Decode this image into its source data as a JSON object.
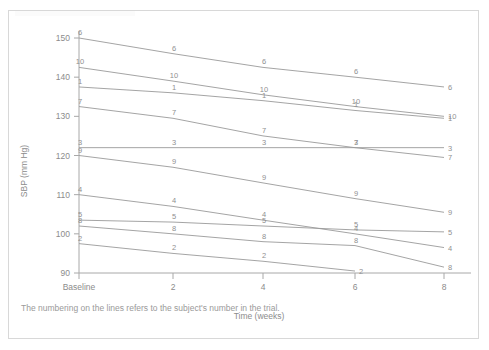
{
  "caption": "The numbering on the lines refers to the subject's number in the trial.",
  "axes": {
    "ylabel": "SBP (mm Hg)",
    "xlabel": "Time (weeks)",
    "ytick_labels": [
      "90",
      "100",
      "110",
      "120",
      "130",
      "140",
      "150"
    ],
    "xtick_labels": [
      "Baseline",
      "2",
      "4",
      "6",
      "8"
    ]
  },
  "colors": {
    "line": "#9a9a9a",
    "axis": "#a8a8a8",
    "text": "#8c8c8c",
    "border": "#d8d8d8",
    "background": "#ffffff"
  },
  "chart_data": {
    "type": "line",
    "title": "",
    "xlabel": "Time (weeks)",
    "ylabel": "SBP (mm Hg)",
    "xlim": [
      0,
      8
    ],
    "ylim": [
      88,
      152
    ],
    "grid": false,
    "legend": "none",
    "x": [
      0,
      2,
      4,
      6,
      8
    ],
    "xtick_labels": [
      "Baseline",
      "2",
      "4",
      "6",
      "8"
    ],
    "ytick_values": [
      90,
      100,
      110,
      120,
      130,
      140,
      150
    ],
    "annotation": "The numbering on the lines refers to the subject's number in the trial.",
    "series": [
      {
        "name": "6",
        "label": "6",
        "values": [
          150.0,
          146.0,
          142.5,
          140.0,
          137.5
        ]
      },
      {
        "name": "10",
        "label": "10",
        "values": [
          142.5,
          139.0,
          135.5,
          132.5,
          130.0
        ]
      },
      {
        "name": "1",
        "label": "1",
        "values": [
          137.5,
          136.0,
          134.0,
          131.5,
          129.5
        ]
      },
      {
        "name": "7",
        "label": "7",
        "values": [
          132.5,
          129.5,
          125.0,
          122.0,
          119.5
        ]
      },
      {
        "name": "3",
        "label": "3",
        "values": [
          122.0,
          122.0,
          122.0,
          122.0,
          122.0
        ]
      },
      {
        "name": "9",
        "label": "9",
        "values": [
          120.0,
          117.0,
          113.0,
          109.0,
          105.5
        ]
      },
      {
        "name": "4",
        "label": "4",
        "values": [
          110.0,
          107.0,
          103.5,
          100.0,
          96.5
        ]
      },
      {
        "name": "5",
        "label": "5",
        "values": [
          103.5,
          103.0,
          102.0,
          101.0,
          100.5
        ]
      },
      {
        "name": "8",
        "label": "8",
        "values": [
          102.0,
          100.0,
          98.0,
          97.0,
          91.5
        ]
      },
      {
        "name": "2",
        "label": "2",
        "values": [
          97.5,
          95.0,
          93.0,
          90.5,
          null
        ]
      }
    ]
  }
}
